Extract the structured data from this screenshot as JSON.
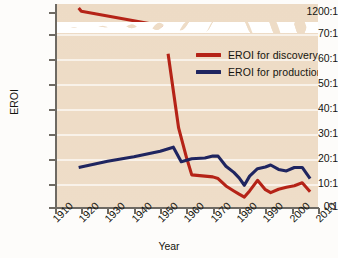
{
  "chart_data": {
    "type": "line",
    "title": "",
    "xlabel": "Year",
    "ylabel": "EROI",
    "xlim": [
      1910,
      2010
    ],
    "ylim": [
      0,
      70
    ],
    "grid": true,
    "legend_position": "upper-right-inside",
    "y_axis_break": {
      "present": true,
      "below_break_max": "70:1",
      "above_break_label": "1200:1",
      "note": "wavy white band separating the 0:1-70:1 range from the 1200:1 tick"
    },
    "x_ticks": [
      "1910",
      "1920",
      "1930",
      "1940",
      "1950",
      "1960",
      "1970",
      "1980",
      "1990",
      "2000",
      "2010"
    ],
    "y_ticks": [
      "0:1",
      "10:1",
      "20:1",
      "30:1",
      "40:1",
      "50:1",
      "60:1",
      "70:1",
      "1200:1"
    ],
    "colors": {
      "discovery": "#b52317",
      "production": "#1f2560",
      "plot_background": "#eedcc6",
      "gridline": "#ffffff",
      "axis": "#6e6a63",
      "text": "#15150f"
    },
    "series": [
      {
        "name": "EROI for discovery",
        "color": "#b52317",
        "points": [
          [
            1919,
            1200
          ],
          [
            1920,
            1000
          ],
          [
            1951,
            75
          ],
          [
            1953,
            62
          ],
          [
            1957,
            32
          ],
          [
            1960,
            20
          ],
          [
            1962,
            13
          ],
          [
            1967,
            12.5
          ],
          [
            1970,
            12.2
          ],
          [
            1972,
            11.5
          ],
          [
            1975,
            8.5
          ],
          [
            1978,
            6.5
          ],
          [
            1980,
            5.2
          ],
          [
            1982,
            4.0
          ],
          [
            1984,
            6.5
          ],
          [
            1987,
            10.8
          ],
          [
            1990,
            7.0
          ],
          [
            1992,
            5.8
          ],
          [
            1995,
            7.2
          ],
          [
            1998,
            8.0
          ],
          [
            2001,
            8.6
          ],
          [
            2004,
            9.8
          ],
          [
            2007,
            6.2
          ]
        ]
      },
      {
        "name": "EROI for production",
        "color": "#1f2560",
        "points": [
          [
            1919,
            16.0
          ],
          [
            1930,
            18.5
          ],
          [
            1940,
            20.3
          ],
          [
            1950,
            22.6
          ],
          [
            1955,
            24.2
          ],
          [
            1958,
            18.3
          ],
          [
            1962,
            19.5
          ],
          [
            1967,
            19.8
          ],
          [
            1970,
            20.6
          ],
          [
            1972,
            20.6
          ],
          [
            1975,
            16.5
          ],
          [
            1978,
            14.0
          ],
          [
            1980,
            11.8
          ],
          [
            1982,
            8.8
          ],
          [
            1984,
            12.5
          ],
          [
            1987,
            15.5
          ],
          [
            1990,
            16.2
          ],
          [
            1992,
            17.0
          ],
          [
            1995,
            15.2
          ],
          [
            1998,
            14.6
          ],
          [
            2001,
            16.0
          ],
          [
            2004,
            16.0
          ],
          [
            2007,
            11.5
          ]
        ]
      }
    ]
  },
  "legend": {
    "items": [
      {
        "label": "EROI for discovery",
        "color": "#b52317"
      },
      {
        "label": "EROI for production",
        "color": "#1f2560"
      }
    ]
  },
  "axes": {
    "y_title": "EROI",
    "x_title": "Year",
    "y_labels": [
      "1200:1",
      "70:1",
      "60:1",
      "50:1",
      "40:1",
      "30:1",
      "20:1",
      "10:1",
      "0:1"
    ],
    "x_labels": [
      "1910",
      "1920",
      "1930",
      "1940",
      "1950",
      "1960",
      "1970",
      "1980",
      "1990",
      "2000",
      "2010"
    ]
  }
}
